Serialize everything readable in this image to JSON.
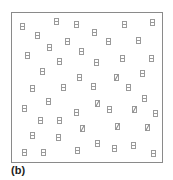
{
  "figure": {
    "label": "(b)",
    "frame": {
      "x": 11,
      "y": 12,
      "width": 152,
      "height": 151,
      "border_color": "#8a8a8a"
    },
    "glyph_color": "#9a9a9a",
    "glyph_size": {
      "width": 5,
      "height": 7
    },
    "glyphs": [
      {
        "x": 22,
        "y": 26,
        "type": "h"
      },
      {
        "x": 56,
        "y": 21,
        "type": "h"
      },
      {
        "x": 76,
        "y": 24,
        "type": "h"
      },
      {
        "x": 124,
        "y": 24,
        "type": "h"
      },
      {
        "x": 152,
        "y": 22,
        "type": "h"
      },
      {
        "x": 37,
        "y": 35,
        "type": "h"
      },
      {
        "x": 94,
        "y": 32,
        "type": "h"
      },
      {
        "x": 108,
        "y": 41,
        "type": "h"
      },
      {
        "x": 138,
        "y": 40,
        "type": "h"
      },
      {
        "x": 49,
        "y": 47,
        "type": "h"
      },
      {
        "x": 67,
        "y": 41,
        "type": "h"
      },
      {
        "x": 81,
        "y": 51,
        "type": "h"
      },
      {
        "x": 27,
        "y": 55,
        "type": "h"
      },
      {
        "x": 59,
        "y": 61,
        "type": "h"
      },
      {
        "x": 96,
        "y": 62,
        "type": "h"
      },
      {
        "x": 122,
        "y": 58,
        "type": "h"
      },
      {
        "x": 151,
        "y": 58,
        "type": "h"
      },
      {
        "x": 42,
        "y": 71,
        "type": "h"
      },
      {
        "x": 79,
        "y": 77,
        "type": "h"
      },
      {
        "x": 116,
        "y": 77,
        "type": "d"
      },
      {
        "x": 142,
        "y": 73,
        "type": "h"
      },
      {
        "x": 32,
        "y": 88,
        "type": "h"
      },
      {
        "x": 63,
        "y": 87,
        "type": "h"
      },
      {
        "x": 93,
        "y": 86,
        "type": "h"
      },
      {
        "x": 128,
        "y": 87,
        "type": "h"
      },
      {
        "x": 48,
        "y": 101,
        "type": "h"
      },
      {
        "x": 97,
        "y": 103,
        "type": "d"
      },
      {
        "x": 144,
        "y": 98,
        "type": "h"
      },
      {
        "x": 24,
        "y": 108,
        "type": "h"
      },
      {
        "x": 76,
        "y": 112,
        "type": "h"
      },
      {
        "x": 109,
        "y": 109,
        "type": "h"
      },
      {
        "x": 134,
        "y": 109,
        "type": "d"
      },
      {
        "x": 155,
        "y": 113,
        "type": "h"
      },
      {
        "x": 40,
        "y": 120,
        "type": "h"
      },
      {
        "x": 59,
        "y": 120,
        "type": "h"
      },
      {
        "x": 82,
        "y": 128,
        "type": "d"
      },
      {
        "x": 117,
        "y": 126,
        "type": "d"
      },
      {
        "x": 147,
        "y": 127,
        "type": "d"
      },
      {
        "x": 32,
        "y": 135,
        "type": "h"
      },
      {
        "x": 58,
        "y": 137,
        "type": "h"
      },
      {
        "x": 24,
        "y": 152,
        "type": "h"
      },
      {
        "x": 43,
        "y": 152,
        "type": "h"
      },
      {
        "x": 77,
        "y": 150,
        "type": "h"
      },
      {
        "x": 97,
        "y": 143,
        "type": "h"
      },
      {
        "x": 114,
        "y": 148,
        "type": "h"
      },
      {
        "x": 133,
        "y": 145,
        "type": "h"
      },
      {
        "x": 153,
        "y": 153,
        "type": "h"
      }
    ]
  }
}
